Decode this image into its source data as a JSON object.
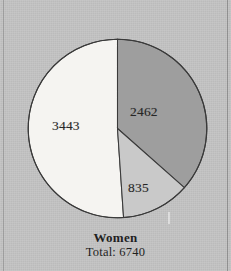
{
  "figure": {
    "background_color": "#c3c3c3",
    "caption_title": "Women",
    "caption_total": "Total: 6740"
  },
  "labels": {
    "slice_1": "2462",
    "slice_2": "835",
    "slice_3": "3443"
  },
  "chart_data": {
    "type": "pie",
    "title": "Women",
    "subtitle": "Total: 6740",
    "total": 6740,
    "categories": [
      "2462",
      "835",
      "3443"
    ],
    "values": [
      2462,
      835,
      3443
    ],
    "data_labels": [
      "2462",
      "835",
      "3443"
    ],
    "percentages": [
      36.5,
      12.4,
      51.1
    ],
    "start_angle_deg": 0,
    "direction": "clockwise",
    "slice_colors": [
      "#9e9e9e",
      "#c9c9c9",
      "#f5f4f1"
    ],
    "slice_edge_color": "#3a3a3a",
    "legend": "none",
    "grid": false,
    "xlabel": "",
    "ylabel": ""
  }
}
